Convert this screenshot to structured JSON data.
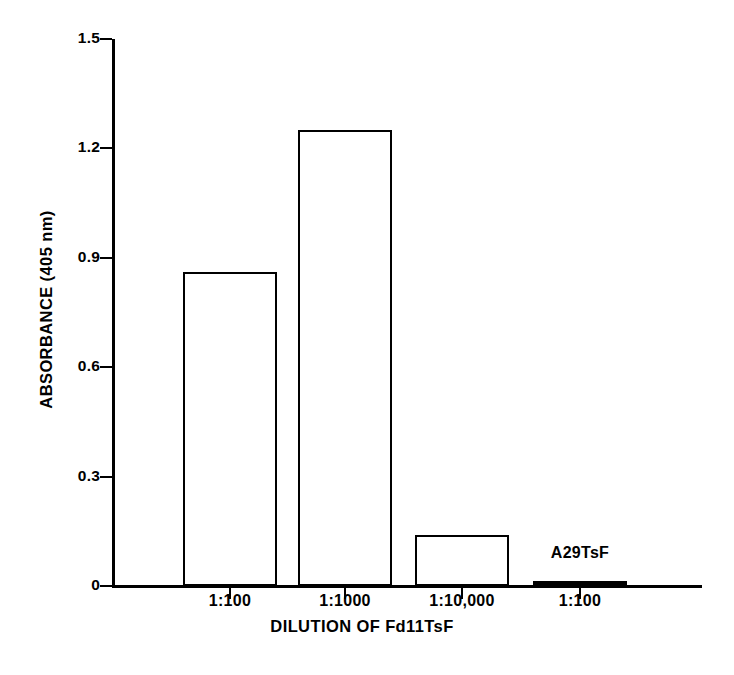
{
  "chart_data": {
    "type": "bar",
    "title": "",
    "xlabel": "DILUTION OF Fd11TsF",
    "ylabel": "ABSORBANCE (405 nm)",
    "categories": [
      "1:100",
      "1:1000",
      "1:10,000",
      "1:100"
    ],
    "values": [
      0.86,
      1.25,
      0.14,
      0.01
    ],
    "ylim": [
      0,
      1.5
    ],
    "ytick_labels": [
      "1.5",
      "1.2",
      "0.9",
      "0.6",
      "0.3",
      "0"
    ],
    "ytick_values": [
      1.5,
      1.2,
      0.9,
      0.6,
      0.3,
      0
    ],
    "grid": false,
    "legend": "none",
    "annotations": [
      {
        "text": "A29TsF",
        "category_index": 3,
        "value": 0.01
      }
    ],
    "series": [
      {
        "name": "Absorbance",
        "values": [
          0.86,
          1.25,
          0.14,
          0.01
        ]
      }
    ],
    "style": {
      "bar_fill": "#ffffff",
      "bar_edge": "#000000",
      "axis_color": "#000000",
      "background": "#ffffff"
    }
  }
}
